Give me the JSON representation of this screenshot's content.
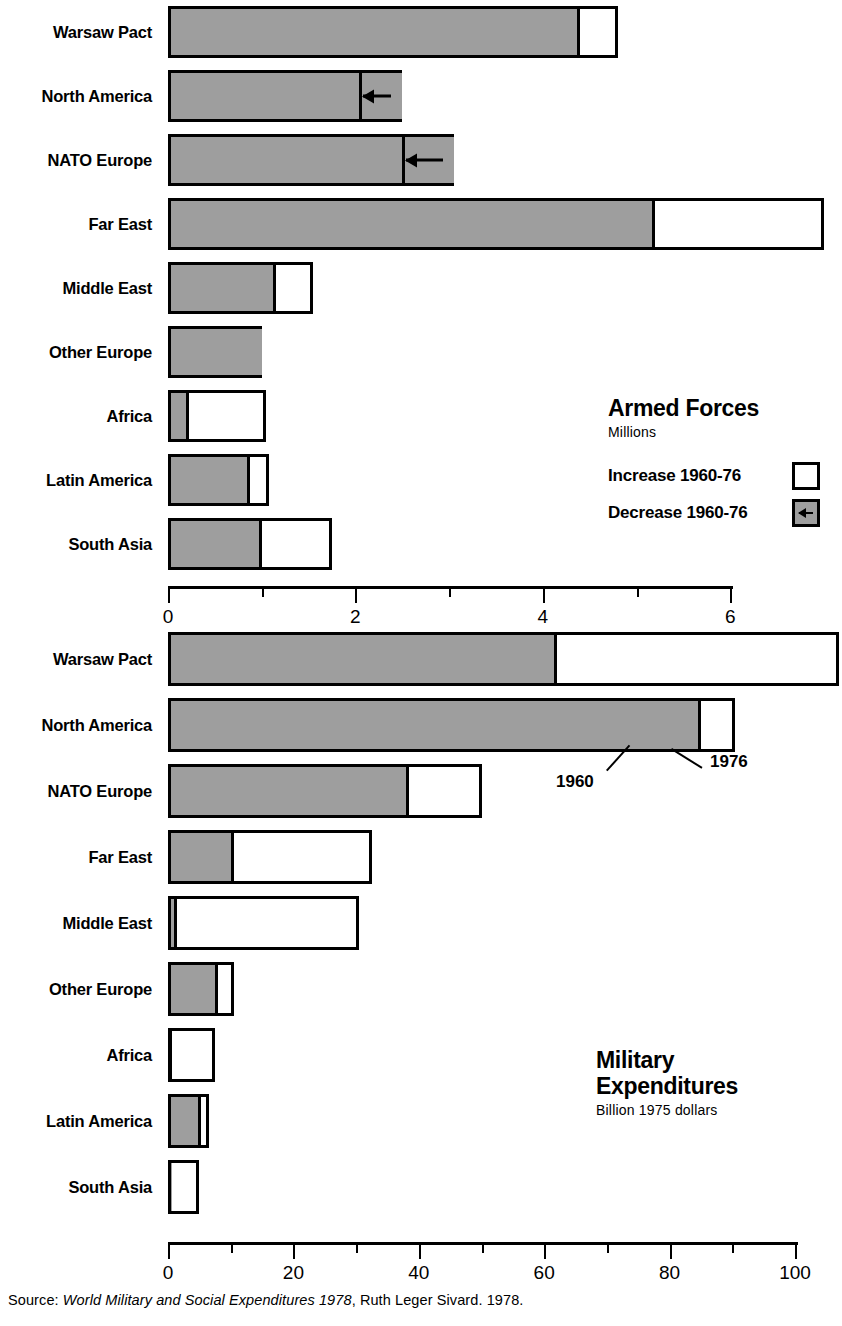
{
  "chart_data": [
    {
      "type": "bar",
      "title": "Armed Forces",
      "subtitle": "Millions",
      "orientation": "horizontal",
      "stacked": true,
      "xlabel": "",
      "ylabel": "",
      "xlim": [
        0,
        7.2
      ],
      "axis_max_tick": 6,
      "tick_step": 1,
      "labeled_ticks": [
        "0",
        "2",
        "4",
        "6"
      ],
      "grid": false,
      "legend_position": "inside-right",
      "categories": [
        "Warsaw Pact",
        "North America",
        "NATO Europe",
        "Far East",
        "Middle East",
        "Other Europe",
        "Africa",
        "Latin America",
        "South Asia"
      ],
      "series": [
        {
          "name": "1960",
          "values": [
            4.4,
            2.5,
            3.05,
            5.2,
            1.15,
            1.0,
            0.22,
            0.88,
            1.0
          ]
        },
        {
          "name": "1976",
          "values": [
            4.8,
            2.07,
            2.53,
            7.0,
            1.55,
            1.0,
            1.05,
            1.08,
            1.75
          ]
        }
      ],
      "change": [
        "increase",
        "decrease",
        "decrease",
        "increase",
        "increase",
        "none",
        "increase",
        "increase",
        "increase"
      ],
      "legend": [
        {
          "label": "Increase 1960-76",
          "swatch": "white"
        },
        {
          "label": "Decrease 1960-76",
          "swatch": "gray-arrow"
        }
      ]
    },
    {
      "type": "bar",
      "title_line1": "Military",
      "title_line2": "Expenditures",
      "subtitle": "Billion 1975 dollars",
      "orientation": "horizontal",
      "stacked": true,
      "xlabel": "",
      "ylabel": "",
      "xlim": [
        0,
        108
      ],
      "axis_max_tick": 100,
      "tick_step": 10,
      "labeled_ticks": [
        "0",
        "20",
        "40",
        "60",
        "80",
        "100"
      ],
      "grid": false,
      "categories": [
        "Warsaw Pact",
        "North America",
        "NATO Europe",
        "Far East",
        "Middle East",
        "Other Europe",
        "Africa",
        "Latin America",
        "South Asia"
      ],
      "series": [
        {
          "name": "1960",
          "values": [
            62.0,
            85.0,
            38.5,
            10.5,
            1.5,
            8.0,
            0.6,
            5.2,
            0.5
          ]
        },
        {
          "name": "1976",
          "values": [
            107.0,
            90.5,
            50.0,
            32.5,
            30.5,
            10.5,
            7.5,
            6.5,
            5.0
          ]
        }
      ],
      "change": [
        "increase",
        "increase",
        "increase",
        "increase",
        "increase",
        "increase",
        "increase",
        "increase",
        "increase"
      ],
      "annotations": [
        {
          "text": "1960",
          "points_to": "north-america-1960-boundary"
        },
        {
          "text": "1976",
          "points_to": "north-america-1976-end"
        }
      ]
    }
  ],
  "top_chart": {
    "legend": {
      "title": "Armed Forces",
      "subtitle": "Millions",
      "rows": [
        {
          "label": "Increase 1960-76"
        },
        {
          "label": "Decrease 1960-76"
        }
      ]
    },
    "axis": {
      "ticks": [
        {
          "value": 0,
          "label": "0"
        },
        {
          "value": 1,
          "label": ""
        },
        {
          "value": 2,
          "label": "2"
        },
        {
          "value": 3,
          "label": ""
        },
        {
          "value": 4,
          "label": "4"
        },
        {
          "value": 5,
          "label": ""
        },
        {
          "value": 6,
          "label": "6"
        }
      ]
    },
    "rows": [
      {
        "label": "Warsaw Pact"
      },
      {
        "label": "North America"
      },
      {
        "label": "NATO Europe"
      },
      {
        "label": "Far East"
      },
      {
        "label": "Middle East"
      },
      {
        "label": "Other Europe"
      },
      {
        "label": "Africa"
      },
      {
        "label": "Latin America"
      },
      {
        "label": "South Asia"
      }
    ]
  },
  "bottom_chart": {
    "legend": {
      "title_line1": "Military",
      "title_line2": "Expenditures",
      "subtitle": "Billion 1975 dollars"
    },
    "axis": {
      "ticks": [
        {
          "value": 0,
          "label": "0"
        },
        {
          "value": 10,
          "label": ""
        },
        {
          "value": 20,
          "label": "20"
        },
        {
          "value": 30,
          "label": ""
        },
        {
          "value": 40,
          "label": "40"
        },
        {
          "value": 50,
          "label": ""
        },
        {
          "value": 60,
          "label": "60"
        },
        {
          "value": 70,
          "label": ""
        },
        {
          "value": 80,
          "label": "80"
        },
        {
          "value": 90,
          "label": ""
        },
        {
          "value": 100,
          "label": "100"
        }
      ]
    },
    "rows": [
      {
        "label": "Warsaw Pact"
      },
      {
        "label": "North America"
      },
      {
        "label": "NATO Europe"
      },
      {
        "label": "Far East"
      },
      {
        "label": "Middle East"
      },
      {
        "label": "Other Europe"
      },
      {
        "label": "Africa"
      },
      {
        "label": "Latin America"
      },
      {
        "label": "South Asia"
      }
    ],
    "annotations": {
      "a1960": "1960",
      "a1976": "1976"
    }
  },
  "source": {
    "prefix": "Source:",
    "italic_title": "World Military and Social Expenditures 1978",
    "suffix": ", Ruth Leger Sivard. 1978."
  }
}
